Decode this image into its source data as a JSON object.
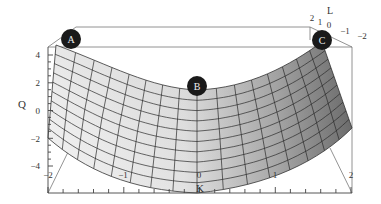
{
  "chart_data": {
    "type": "surface3d",
    "title": "",
    "xlabel": "K",
    "ylabel": "Q",
    "zlabel": "L",
    "xlim": [
      -2,
      2
    ],
    "ylim": [
      -4,
      4
    ],
    "zlim": [
      -2,
      2
    ],
    "x_ticks": [
      "-2",
      "-1",
      "0",
      "1",
      "2"
    ],
    "y_ticks": [
      "4",
      "2",
      "0",
      "-2",
      "-4"
    ],
    "z_ticks": [
      "2",
      "1",
      "0",
      "-1",
      "-2"
    ],
    "surface": "saddle-like curved sheet, Q ≈ K^2 along front edge, mesh grid with shading",
    "points": [
      {
        "label": "A",
        "K": -1.7,
        "Q": 4.5
      },
      {
        "label": "B",
        "K": 0,
        "Q": 1.5
      },
      {
        "label": "C",
        "K": 1.6,
        "Q": 4.5
      }
    ],
    "grid": false,
    "legend": "none"
  },
  "axes": {
    "x_label": "K",
    "y_label": "Q",
    "z_label": "L",
    "x_ticks": [
      {
        "text": "−2",
        "x": 48
      },
      {
        "text": "−1",
        "x": 123
      },
      {
        "text": "0",
        "x": 199
      },
      {
        "text": "1",
        "x": 275
      },
      {
        "text": "2",
        "x": 351
      }
    ],
    "y_ticks": [
      {
        "text": "4",
        "y": 55
      },
      {
        "text": "2",
        "y": 83
      },
      {
        "text": "0",
        "y": 111
      },
      {
        "text": "−2",
        "y": 139
      },
      {
        "text": "−4",
        "y": 166
      }
    ],
    "z_ticks": [
      {
        "text": "2",
        "x": 312,
        "y": 21
      },
      {
        "text": "1",
        "x": 320,
        "y": 25
      },
      {
        "text": "0",
        "x": 329,
        "y": 28
      },
      {
        "text": "−1",
        "x": 345,
        "y": 34
      },
      {
        "text": "−2",
        "x": 362,
        "y": 39
      }
    ]
  },
  "markers": [
    {
      "label": "A",
      "cx": 71,
      "cy": 39
    },
    {
      "label": "B",
      "cx": 197,
      "cy": 86
    },
    {
      "label": "C",
      "cx": 322,
      "cy": 40
    }
  ]
}
